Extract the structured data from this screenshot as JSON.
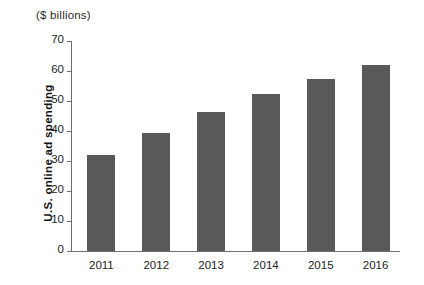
{
  "chart_data": {
    "type": "bar",
    "title": "",
    "unit_caption": "($ billions)",
    "categories": [
      "2011",
      "2012",
      "2013",
      "2014",
      "2015",
      "2016"
    ],
    "values": [
      32,
      39.5,
      46.5,
      52.5,
      57.5,
      62
    ],
    "series": [
      {
        "name": "U.S. online ad spending",
        "values": [
          32,
          39.5,
          46.5,
          52.5,
          57.5,
          62
        ]
      }
    ],
    "xlabel": "",
    "ylabel": "U.S. online ad spending",
    "ylim": [
      0,
      70
    ],
    "yticks": [
      0,
      10,
      20,
      30,
      40,
      50,
      60,
      70
    ],
    "ytick_labels": [
      "0",
      "10",
      "20",
      "30",
      "40",
      "50",
      "60",
      "70"
    ],
    "grid": false,
    "legend": false,
    "bar_color": "#595959",
    "axis_color": "#6e6e6e",
    "background_color": "#ffffff"
  }
}
